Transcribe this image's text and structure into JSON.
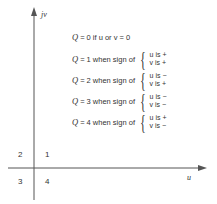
{
  "axes": {
    "vertical_label": "jv",
    "horizontal_label": "u"
  },
  "quadrants": {
    "q1": "1",
    "q2": "2",
    "q3": "3",
    "q4": "4"
  },
  "rules": [
    {
      "q": "Q",
      "text": "= 0 if u or v = 0"
    },
    {
      "q": "Q",
      "text": "= 1 when sign of",
      "u_sign": "u  is +",
      "v_sign": "v  is +"
    },
    {
      "q": "Q",
      "text": "= 2 when sign of",
      "u_sign": "u  is −",
      "v_sign": "v  is +"
    },
    {
      "q": "Q",
      "text": "= 3 when sign of",
      "u_sign": "u  is −",
      "v_sign": "v  is −"
    },
    {
      "q": "Q",
      "text": "= 4 when sign of",
      "u_sign": "u  is +",
      "v_sign": "v  is −"
    }
  ]
}
